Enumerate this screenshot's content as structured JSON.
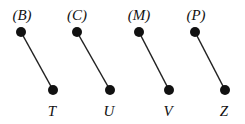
{
  "diagram": {
    "pairs": [
      {
        "top_label": "(B)",
        "bottom_label": "T",
        "top": [
          21,
          32
        ],
        "bottom": [
          53,
          90
        ],
        "top_label_pos": [
          22,
          20
        ],
        "bottom_label_pos": [
          52,
          116
        ]
      },
      {
        "top_label": "(C)",
        "bottom_label": "U",
        "top": [
          77,
          32
        ],
        "bottom": [
          110,
          90
        ],
        "top_label_pos": [
          77,
          20
        ],
        "bottom_label_pos": [
          109,
          116
        ]
      },
      {
        "top_label": "(M)",
        "bottom_label": "V",
        "top": [
          139,
          32
        ],
        "bottom": [
          169,
          90
        ],
        "top_label_pos": [
          139,
          20
        ],
        "bottom_label_pos": [
          168,
          116
        ]
      },
      {
        "top_label": "(P)",
        "bottom_label": "Z",
        "top": [
          195,
          32
        ],
        "bottom": [
          225,
          90
        ],
        "top_label_pos": [
          196,
          20
        ],
        "bottom_label_pos": [
          224,
          116
        ]
      }
    ],
    "node_color": "#111111",
    "edge_color": "#222222"
  }
}
